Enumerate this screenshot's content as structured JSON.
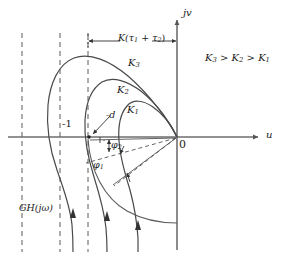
{
  "figure": {
    "type": "nyquist-polar-plot",
    "axes": {
      "real_axis_label": "u",
      "imag_axis_label": "jv",
      "origin_label": "0",
      "critical_point_label": "-1"
    },
    "annotations": {
      "dimension_label": "K(τ1 + τ2)",
      "dimension_label_parts": {
        "head": "K(",
        "t1": "τ",
        "t1sub": "1",
        "mid": " + ",
        "t2": "τ",
        "t2sub": "2",
        "tail": ")"
      },
      "gain_order": "K3 > K2 > K1",
      "gain_order_parts": {
        "k3": "K",
        "k3sub": "3",
        "gt1": " > ",
        "k2": "K",
        "k2sub": "2",
        "gt2": " > ",
        "k1": "K",
        "k1sub": "1"
      },
      "distance_label": "-d",
      "transfer_function_label": "GH(jω)",
      "transfer_function_parts": {
        "gh": "GH(",
        "j": "j",
        "omega": "ω",
        "close": ")"
      },
      "phase_margin_2": "φ2",
      "phase_margin_2_parts": {
        "phi": "φ",
        "sub": "2"
      },
      "phase_margin_1": "φ1",
      "phase_margin_1_parts": {
        "phi": "φ",
        "sub": "1"
      }
    },
    "curves": [
      {
        "name": "K1",
        "label": "K",
        "label_sub": "1",
        "gain_rank": 1
      },
      {
        "name": "K2",
        "label": "K",
        "label_sub": "2",
        "gain_rank": 2
      },
      {
        "name": "K3",
        "label": "K",
        "label_sub": "3",
        "gain_rank": 3
      }
    ],
    "colors": {
      "curve": "#4a4a4a",
      "axis": "#6e6e6e",
      "dashed": "#5a5a5a",
      "text": "#1a1a1a",
      "background": "#ffffff"
    }
  }
}
